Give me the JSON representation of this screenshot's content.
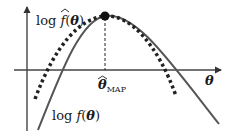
{
  "diagram": {
    "type": "laplace-approximation-plot",
    "axes": {
      "x_label": "θ",
      "y_arrow": true,
      "x_arrow": true
    },
    "curves": [
      {
        "name": "approx",
        "label_prefix": "log ",
        "label_func": "f",
        "label_hat": true,
        "label_arg": "(θ)",
        "style": "dotted",
        "color": "#222222"
      },
      {
        "name": "true",
        "label_prefix": "log ",
        "label_func": "f",
        "label_hat": false,
        "label_arg": "(θ)",
        "style": "solid",
        "color": "#555555"
      }
    ],
    "peak": {
      "label_symbol": "θ",
      "label_subscript": "MAP",
      "marker": "filled-circle"
    }
  }
}
